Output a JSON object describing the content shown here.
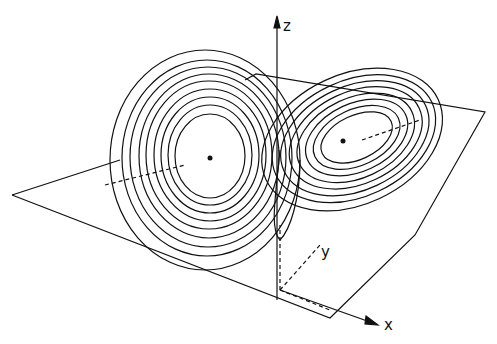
{
  "figure": {
    "axes": {
      "z_label": "z",
      "y_label": "y",
      "x_label": "x"
    },
    "colors": {
      "ink": "#111111",
      "background": "#ffffff"
    }
  }
}
